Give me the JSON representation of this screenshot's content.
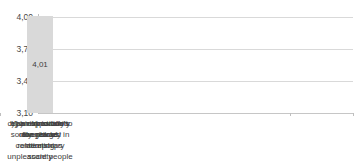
{
  "chart_data": {
    "type": "bar",
    "categories": [
      "a) intrinsically dangerous",
      "b) an opportunity to enlarge relationships",
      "c) an exposition to the risk of meeting unpleasant people",
      "d) an innovation sorely needed in contemporary society",
      "e) a risk to one's own privacy"
    ],
    "category_lines": [
      "a) intrinsically\ndangerous",
      "b) an opportunity\nto enlarge\nrelationships",
      "c) an exposition to\nthe risk of\nmeeting\nunpleasant people",
      "d) an innovation\nsorely needed in\ncontemporary\nsociety",
      "e) a risk to one's\nown privacy"
    ],
    "values": [
      3.34,
      3.17,
      3.41,
      3.16,
      4.01
    ],
    "value_labels": [
      "3,34",
      "3,17",
      "3,41",
      "3,16",
      "4,01"
    ],
    "yticks": [
      "4,00",
      "3,70",
      "3,40",
      "3,10"
    ],
    "ytick_values": [
      4.0,
      3.7,
      3.4,
      3.1
    ],
    "ylim": [
      3.1,
      4.1
    ],
    "ytick_step": 0.3,
    "bar_colors": [
      "#a5a5a5",
      "#d9d9d9",
      "#d9d9d9",
      "#d9d9d9",
      "#d9d9d9"
    ],
    "gridline_color": "#d9d9d9",
    "axis_color": "#bfbfbf",
    "text_color": "#404040",
    "grid": true,
    "legend": "none",
    "title": ""
  }
}
